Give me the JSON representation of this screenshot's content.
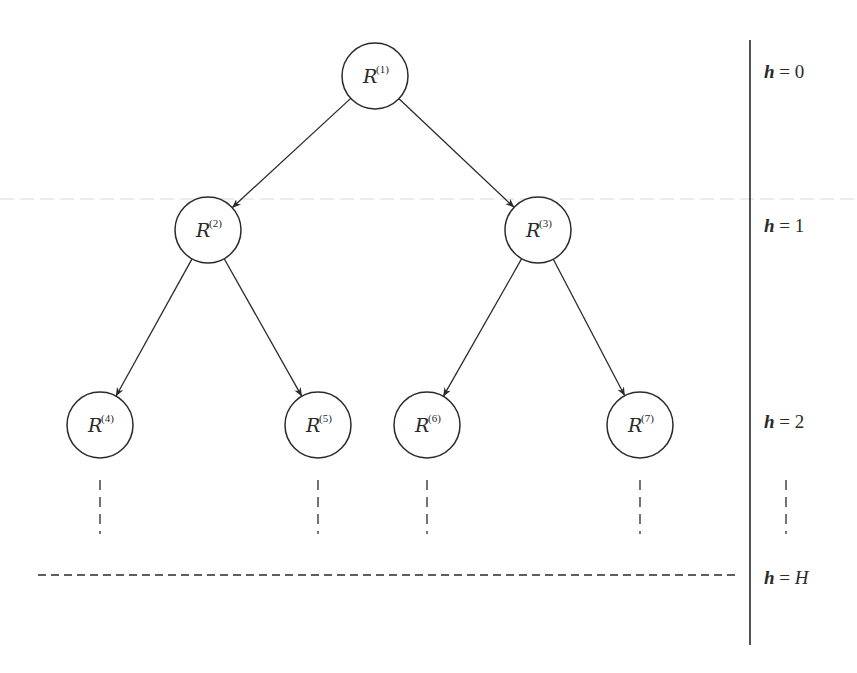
{
  "diagram": {
    "type": "binary-tree",
    "colors": {
      "stroke": "#2a2a2a",
      "text": "#2a2a2a",
      "faint_line": "#e4e4e4",
      "background": "#ffffff"
    },
    "nodes": [
      {
        "id": "1",
        "base": "R",
        "sup": "(1)",
        "cx": 375,
        "cy": 76
      },
      {
        "id": "2",
        "base": "R",
        "sup": "(2)",
        "cx": 208,
        "cy": 230
      },
      {
        "id": "3",
        "base": "R",
        "sup": "(3)",
        "cx": 538,
        "cy": 230
      },
      {
        "id": "4",
        "base": "R",
        "sup": "(4)",
        "cx": 100,
        "cy": 425
      },
      {
        "id": "5",
        "base": "R",
        "sup": "(5)",
        "cx": 318,
        "cy": 425
      },
      {
        "id": "6",
        "base": "R",
        "sup": "(6)",
        "cx": 427,
        "cy": 425
      },
      {
        "id": "7",
        "base": "R",
        "sup": "(7)",
        "cx": 640,
        "cy": 425
      }
    ],
    "node_radius": 33,
    "edges": [
      {
        "from": "1",
        "to": "2"
      },
      {
        "from": "1",
        "to": "3"
      },
      {
        "from": "2",
        "to": "4"
      },
      {
        "from": "2",
        "to": "5"
      },
      {
        "from": "3",
        "to": "6"
      },
      {
        "from": "3",
        "to": "7"
      }
    ],
    "levels": [
      {
        "var": "h",
        "eq": " = ",
        "value": "0",
        "y": 78
      },
      {
        "var": "h",
        "eq": " = ",
        "value": "1",
        "y": 232
      },
      {
        "var": "h",
        "eq": " = ",
        "value": "2",
        "y": 428
      },
      {
        "var": "h",
        "eq": " = ",
        "value": "H",
        "y": 584
      }
    ],
    "continuation_x": [
      100,
      318,
      427,
      640,
      786
    ],
    "bottom_level_line": {
      "x1": 38,
      "x2": 735,
      "y": 575
    },
    "divider": {
      "x": 750,
      "y1": 40,
      "y2": 645
    }
  }
}
